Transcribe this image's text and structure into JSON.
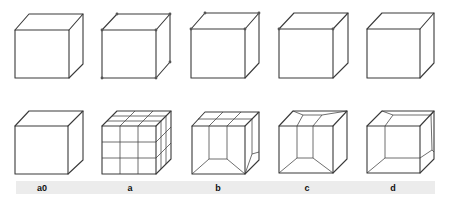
{
  "figure": {
    "labels": [
      "a0",
      "a",
      "b",
      "c",
      "d"
    ],
    "colors": {
      "line": "#3a3a3a",
      "vertex": "#555555",
      "label_band": "#ececec",
      "background": "#ffffff"
    },
    "top_row": [
      {
        "id": "a0",
        "vertex_markers": "none"
      },
      {
        "id": "a",
        "vertex_markers": "all visible corners"
      },
      {
        "id": "b",
        "vertex_markers": "top four corners"
      },
      {
        "id": "c",
        "vertex_markers": "front top two corners"
      },
      {
        "id": "d",
        "vertex_markers": "none"
      }
    ],
    "bottom_row": [
      {
        "id": "a0",
        "subdivision": "plain cube"
      },
      {
        "id": "a",
        "subdivision": "3x3x3 grid"
      },
      {
        "id": "b",
        "subdivision": "top face 3x2 grid, front inset column with bevel"
      },
      {
        "id": "c",
        "subdivision": "inset column with slanted top bevel"
      },
      {
        "id": "d",
        "subdivision": "inset corner with bevel"
      }
    ]
  }
}
